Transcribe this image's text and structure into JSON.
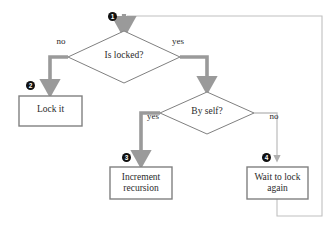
{
  "diagram": {
    "colors": {
      "shape_stroke": "#808080",
      "shape_fill": "#ffffff",
      "arrow_thick": "#9a9a9a",
      "arrow_thin": "#c0c0c0",
      "text": "#2b2b2b",
      "badge_fill": "#111111",
      "badge_text": "#ffffff"
    },
    "nodes": [
      {
        "id": "is-locked",
        "shape": "diamond",
        "label": "Is locked?",
        "badge": "1",
        "cx": 124,
        "cy": 57,
        "rx": 56,
        "ry": 26
      },
      {
        "id": "lock-it",
        "shape": "box",
        "label": "Lock it",
        "badge": "2",
        "x": 19,
        "y": 96,
        "width": 63,
        "height": 30
      },
      {
        "id": "by-self",
        "shape": "diamond",
        "label": "By self?",
        "badge": null,
        "cx": 207,
        "cy": 113,
        "rx": 47,
        "ry": 21
      },
      {
        "id": "increment-recursion",
        "shape": "box",
        "label": "Increment\nrecursion",
        "badge": "3",
        "x": 110,
        "y": 167,
        "width": 62,
        "height": 32
      },
      {
        "id": "wait-to-lock-again",
        "shape": "box",
        "label": "Wait to lock\nagain",
        "badge": "4",
        "x": 247,
        "y": 167,
        "width": 61,
        "height": 32
      }
    ],
    "edge_labels": [
      {
        "id": "is-locked-no",
        "text": "no",
        "x": 52,
        "y": 36
      },
      {
        "id": "is-locked-yes",
        "text": "yes",
        "x": 168,
        "y": 36
      },
      {
        "id": "by-self-yes",
        "text": "yes",
        "x": 143,
        "y": 111
      },
      {
        "id": "by-self-no",
        "text": "no",
        "x": 265,
        "y": 111
      }
    ]
  }
}
